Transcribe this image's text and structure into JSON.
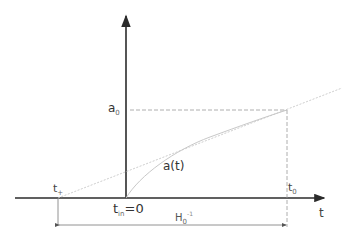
{
  "diagram": {
    "type": "scale-factor timeline sketch",
    "axes": {
      "x_label": "t",
      "y_label": ""
    },
    "labels": {
      "a0": {
        "main": "a",
        "sub": "0"
      },
      "a_of_t": "a(t)",
      "t_plus": {
        "main": "t",
        "sub": "+"
      },
      "t_in": {
        "main": "t",
        "sub": "in",
        "suffix": "=0"
      },
      "t0": {
        "main": "t",
        "sub": "0"
      },
      "hubble_time": {
        "main": "H",
        "sub": "0",
        "sup": "-1"
      },
      "t_axis": "t"
    },
    "colors": {
      "axis": "#2b2b2b",
      "dashed": "#9a9a9a",
      "curve": "#c8c8c8",
      "text": "#333333"
    }
  }
}
